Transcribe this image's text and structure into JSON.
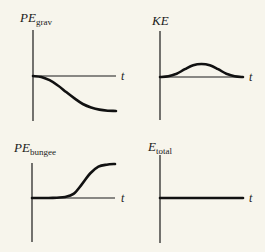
{
  "chart_data": [
    {
      "type": "line",
      "title_main": "PE",
      "title_sub": "grav",
      "xlabel": "t",
      "ylabel": "PE_grav",
      "description": "Starts at zero, decreases smoothly (S-shaped) to a negative plateau",
      "x": [
        0,
        0.1,
        0.2,
        0.3,
        0.4,
        0.5,
        0.6,
        0.7,
        0.8,
        0.9,
        1.0
      ],
      "values": [
        0,
        -0.03,
        -0.12,
        -0.27,
        -0.46,
        -0.64,
        -0.8,
        -0.9,
        -0.96,
        -0.99,
        -1.0
      ],
      "ylim": [
        -1.2,
        1.2
      ]
    },
    {
      "type": "line",
      "title_main": "KE",
      "title_sub": "",
      "xlabel": "t",
      "ylabel": "KE",
      "description": "Starts at zero, rises to a maximum mid-way, returns to zero",
      "x": [
        0,
        0.1,
        0.2,
        0.3,
        0.4,
        0.5,
        0.6,
        0.7,
        0.8,
        0.9,
        1.0
      ],
      "values": [
        0,
        0.05,
        0.25,
        0.6,
        0.9,
        1.0,
        0.9,
        0.6,
        0.25,
        0.05,
        0
      ],
      "ylim": [
        -1.2,
        1.2
      ]
    },
    {
      "type": "line",
      "title_main": "PE",
      "title_sub": "bungee",
      "xlabel": "t",
      "ylabel": "PE_bungee",
      "description": "Zero until bungee becomes taut, then rises smoothly to a positive plateau",
      "x": [
        0,
        0.1,
        0.2,
        0.3,
        0.4,
        0.5,
        0.6,
        0.7,
        0.8,
        0.9,
        1.0
      ],
      "values": [
        0,
        0,
        0,
        0.01,
        0.03,
        0.12,
        0.4,
        0.72,
        0.92,
        0.98,
        1.0
      ],
      "ylim": [
        -1.2,
        1.2
      ]
    },
    {
      "type": "line",
      "title_main": "E",
      "title_sub": "total",
      "xlabel": "t",
      "ylabel": "E_total",
      "description": "Constant (flat line) at zero level",
      "x": [
        0,
        1.0
      ],
      "values": [
        0,
        0
      ],
      "ylim": [
        -1.2,
        1.2
      ]
    }
  ]
}
